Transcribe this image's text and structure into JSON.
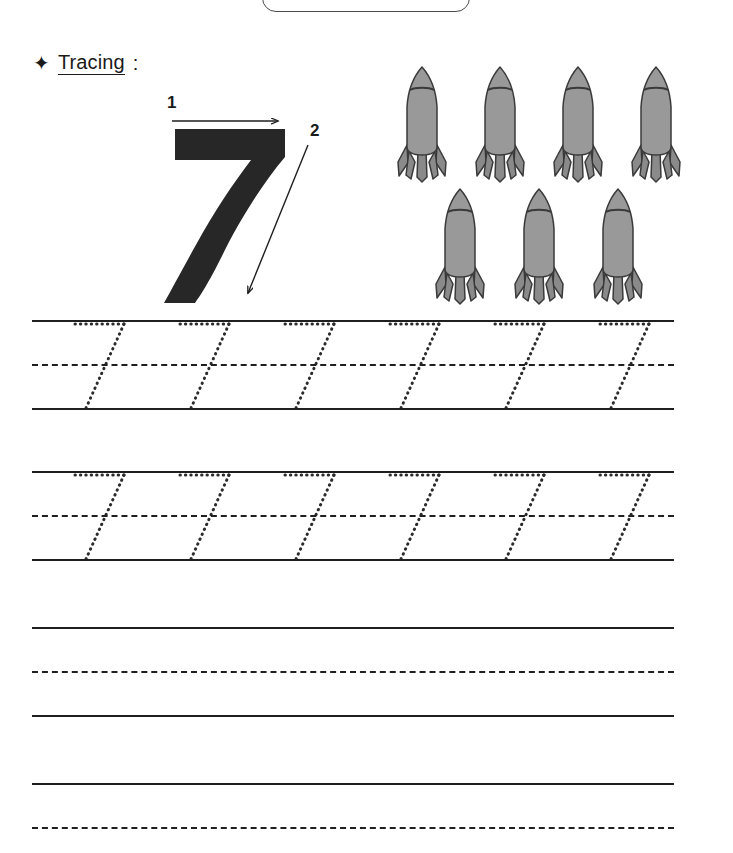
{
  "worksheet": {
    "kind": "number-tracing-worksheet",
    "target_number": "7",
    "title_box": {
      "label": ""
    },
    "heading": {
      "bullet_icon": "four-point-star-icon",
      "bullet_glyph": "✦",
      "word": "Tracing",
      "colon": ":"
    },
    "model_digit": {
      "digit": "7",
      "stroke_labels": [
        "1",
        "2"
      ],
      "stroke_one_hint": "horizontal arrow pointing right across the top bar",
      "stroke_two_hint": "diagonal arrow pointing down-left along the stem",
      "fill_color": "#272727"
    },
    "counting_illustration": {
      "object_name": "rocket",
      "object_icon": "rocket-icon",
      "total_count": 7,
      "rows": [
        {
          "row_label": "top-row",
          "count": 4
        },
        {
          "row_label": "bottom-row",
          "count": 3
        }
      ],
      "body_color": "#999999",
      "fin_color": "#8a8a8a",
      "outline_color": "#3a3a3a"
    },
    "practice_rows": [
      {
        "row_label": "traced-row-1",
        "guides": 6,
        "has_dotted_digits": true,
        "lines": [
          "solid",
          "dashed",
          "solid"
        ]
      },
      {
        "row_label": "traced-row-2",
        "guides": 6,
        "has_dotted_digits": true,
        "lines": [
          "solid",
          "dashed",
          "solid"
        ]
      },
      {
        "row_label": "blank-row-1",
        "guides": 0,
        "has_dotted_digits": false,
        "lines": [
          "solid",
          "dashed",
          "solid"
        ]
      },
      {
        "row_label": "blank-row-2",
        "guides": 0,
        "has_dotted_digits": false,
        "lines": [
          "solid",
          "dashed"
        ]
      }
    ],
    "guide_x_positions": [
      40,
      145,
      250,
      355,
      460,
      565
    ],
    "colors": {
      "ink": "#1f1f1f",
      "rule_line": "#1f1f1f",
      "dotted_guide": "#2b2b2b",
      "paper": "#ffffff"
    }
  }
}
